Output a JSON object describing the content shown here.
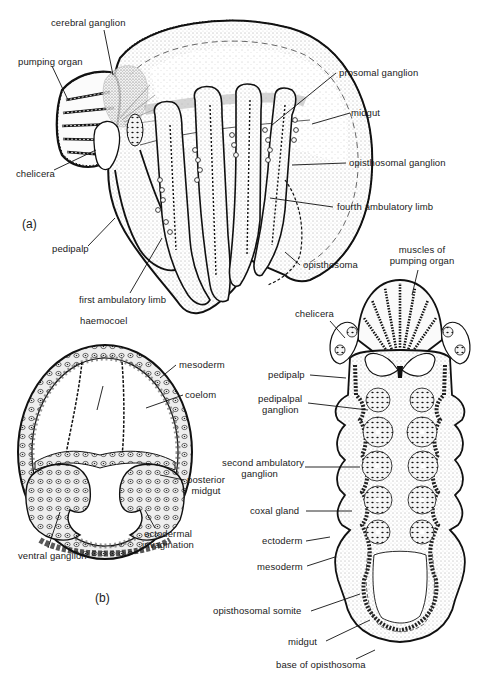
{
  "figure": {
    "panels": {
      "a": "(a)",
      "b": "(b)"
    },
    "colors": {
      "ink": "#1a1a1a",
      "background": "#ffffff",
      "stipple": "#d9d9d9",
      "dense_stipple": "#bdbdbd"
    },
    "panel_a_labels": {
      "cerebral_ganglion": "cerebral ganglion",
      "pumping_organ": "pumping organ",
      "chelicera": "chelicera",
      "pedipalp": "pedipalp",
      "first_ambulatory_limb": "first ambulatory limb",
      "prosomal_ganglion": "prosomal ganglion",
      "midgut": "midgut",
      "opisthosomal_ganglion": "opisthosomal ganglion",
      "fourth_ambulatory_limb": "fourth ambulatory limb",
      "opisthosoma": "opisthosoma"
    },
    "panel_b_left_labels": {
      "haemocoel": "haemocoel",
      "mesoderm": "mesoderm",
      "coelom": "coelom",
      "posterior_midgut_line1": "posterior",
      "posterior_midgut_line2": "midgut",
      "ectodermal_invagination_line1": "ectodermal",
      "ectodermal_invagination_line2": "invagination",
      "ventral_ganglion": "ventral ganglion"
    },
    "panel_b_right_labels": {
      "muscles_of_pumping_organ_line1": "muscles of",
      "muscles_of_pumping_organ_line2": "pumping organ",
      "chelicera": "chelicera",
      "pedipalp": "pedipalp",
      "pedipalpal_ganglion_line1": "pedipalpal",
      "pedipalpal_ganglion_line2": "ganglion",
      "second_ambulatory_ganglion_line1": "second ambulatory",
      "second_ambulatory_ganglion_line2": "ganglion",
      "coxal_gland": "coxal gland",
      "ectoderm": "ectoderm",
      "mesoderm": "mesoderm",
      "opisthosomal_somite": "opisthosomal somite",
      "midgut": "midgut",
      "base_of_opisthosoma": "base of opisthosoma"
    }
  }
}
